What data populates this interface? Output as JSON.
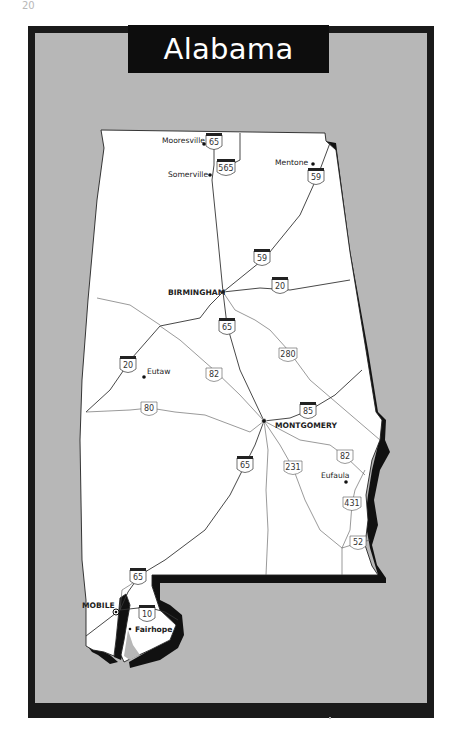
{
  "page": {
    "number": "20"
  },
  "map": {
    "title": "Alabama",
    "colors": {
      "frame": "#1a1a1a",
      "background": "#b7b7b7",
      "land": "#ffffff",
      "title_bg": "#0d0d0d",
      "title_text": "#ffffff"
    },
    "cities": [
      {
        "name": "Mooresville",
        "style": "regular",
        "x": 204,
        "y": 143
      },
      {
        "name": "Somerville",
        "style": "regular",
        "x": 210,
        "y": 175
      },
      {
        "name": "Mentone",
        "style": "regular",
        "x": 313,
        "y": 164
      },
      {
        "name": "BIRMINGHAM",
        "style": "capital-bold",
        "x": 223,
        "y": 292
      },
      {
        "name": "Eutaw",
        "style": "regular",
        "x": 144,
        "y": 376
      },
      {
        "name": "MONTGOMERY",
        "style": "capital-bold",
        "x": 264,
        "y": 421
      },
      {
        "name": "Eufaula",
        "style": "regular",
        "x": 346,
        "y": 482
      },
      {
        "name": "MOBILE",
        "style": "capital-bold",
        "x": 116,
        "y": 612
      },
      {
        "name": "Fairhope",
        "style": "bold",
        "x": 130,
        "y": 629
      }
    ],
    "interstate_shields": [
      {
        "number": "65",
        "x": 214,
        "y": 143
      },
      {
        "number": "565",
        "x": 225,
        "y": 169
      },
      {
        "number": "59",
        "x": 316,
        "y": 178
      },
      {
        "number": "59",
        "x": 262,
        "y": 259
      },
      {
        "number": "20",
        "x": 280,
        "y": 286
      },
      {
        "number": "65",
        "x": 227,
        "y": 328
      },
      {
        "number": "20",
        "x": 128,
        "y": 365
      },
      {
        "number": "85",
        "x": 308,
        "y": 411
      },
      {
        "number": "65",
        "x": 245,
        "y": 465
      },
      {
        "number": "65",
        "x": 138,
        "y": 577
      },
      {
        "number": "10",
        "x": 147,
        "y": 615
      }
    ],
    "us_highway_shields": [
      {
        "number": "280",
        "x": 288,
        "y": 354
      },
      {
        "number": "82",
        "x": 214,
        "y": 375
      },
      {
        "number": "80",
        "x": 149,
        "y": 409
      },
      {
        "number": "231",
        "x": 293,
        "y": 468
      },
      {
        "number": "82",
        "x": 345,
        "y": 456
      },
      {
        "number": "431",
        "x": 352,
        "y": 504
      },
      {
        "number": "52",
        "x": 358,
        "y": 543
      }
    ]
  }
}
